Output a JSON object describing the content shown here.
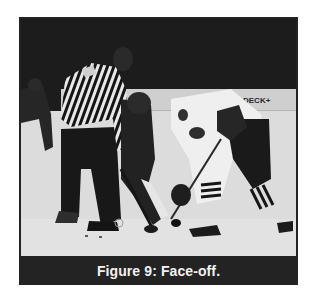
{
  "figure": {
    "caption": "Figure 9: Face-off.",
    "photo": {
      "subject": "ice-hockey-face-off",
      "board_sign_text": "DECK+",
      "description": "Referee in striped shirt between two players taking a face-off on ice; dark player on left, white-jersey player on right"
    }
  },
  "colors": {
    "frame": "#232323",
    "caption_text": "#f2f2f2",
    "ice": "#dcdcdc",
    "background_dark": "#1b1b1b"
  }
}
